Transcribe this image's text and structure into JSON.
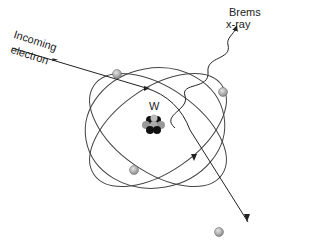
{
  "diagram": {
    "labels": {
      "incoming_line1": "Incoming",
      "incoming_line2": "electron",
      "brems_line1": "Brems",
      "brems_line2": "x-ray",
      "nucleus": "W"
    },
    "elements": {
      "nucleus": "tungsten (W) nucleus",
      "orbits": 3,
      "orbital_electrons": 4,
      "incoming_electron_path": "deflected near nucleus, exits lower right",
      "photon": "wavy line to upper right"
    },
    "colors": {
      "line": "#333333",
      "electron_fill": "#a8a8a8",
      "nucleus_dark": "#111111",
      "nucleus_light": "#9a9a9a"
    }
  }
}
